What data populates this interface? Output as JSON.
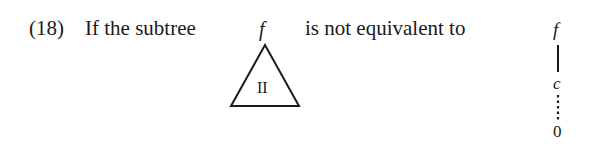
{
  "statement": {
    "label": "(18)",
    "lead_text": "If the subtree",
    "middle_text": "is not equivalent to"
  },
  "subtree": {
    "root_label": "f",
    "triangle_label": "II"
  },
  "chain": {
    "top_label": "f",
    "middle_label": "c",
    "bottom_label": "0",
    "solid_edge": "f-c",
    "dotted_edge": "c-0"
  }
}
